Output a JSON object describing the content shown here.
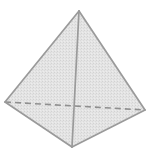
{
  "diagram": {
    "shape": "tetrahedron",
    "colors": {
      "background": "#ffffff",
      "face_fill": "#e3e3e3",
      "face_fill_shade": "#d9d9d9",
      "edge": "#9a9a9a",
      "hidden_edge": "#8f8f8f"
    },
    "vertices": {
      "apex": [
        79,
        11
      ],
      "left": [
        5,
        102
      ],
      "right": [
        145,
        110
      ],
      "front": [
        72,
        147
      ]
    },
    "visible_edges": [
      [
        "apex",
        "left"
      ],
      [
        "apex",
        "right"
      ],
      [
        "apex",
        "front"
      ],
      [
        "left",
        "front"
      ],
      [
        "right",
        "front"
      ]
    ],
    "hidden_edges": [
      [
        "left",
        "right"
      ]
    ]
  }
}
